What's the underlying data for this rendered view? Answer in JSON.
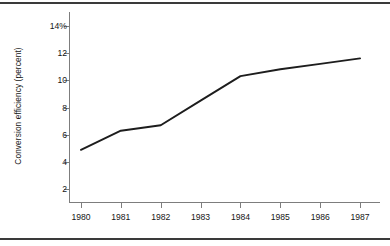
{
  "figure": {
    "background_color": "#ffffff",
    "line_color": "#1d1d1d",
    "axis_color": "#7d7d7d",
    "rule_color": "#3a3a3a"
  },
  "chart_data": {
    "type": "line",
    "title": "",
    "subtitle": "",
    "xlabel": "",
    "ylabel": "Conversion efficiency (percent)",
    "categories": [
      "1980",
      "1981",
      "1982",
      "1983",
      "1984",
      "1985",
      "1986",
      "1987"
    ],
    "x": [
      1980,
      1981,
      1982,
      1983,
      1984,
      1985,
      1986,
      1987
    ],
    "values": [
      4.9,
      6.3,
      6.7,
      8.5,
      10.3,
      10.8,
      11.2,
      11.6
    ],
    "series": [
      {
        "name": "Conversion efficiency",
        "values": [
          4.9,
          6.3,
          6.7,
          8.5,
          10.3,
          10.8,
          11.2,
          11.6
        ]
      }
    ],
    "xlim": [
      1979.7,
      1987.5
    ],
    "ylim": [
      1.0,
      15.0
    ],
    "yticks": [
      2,
      4,
      6,
      8,
      10,
      12,
      14
    ],
    "ytick_labels": [
      "2",
      "4",
      "6",
      "8",
      "10",
      "12",
      "14%"
    ],
    "xticks": [
      1980,
      1981,
      1982,
      1983,
      1984,
      1985,
      1986,
      1987
    ],
    "xtick_labels": [
      "1980",
      "1981",
      "1982",
      "1983",
      "1984",
      "1985",
      "1986",
      "1987"
    ],
    "grid": false,
    "legend": null,
    "annotations": [],
    "markers": false
  }
}
